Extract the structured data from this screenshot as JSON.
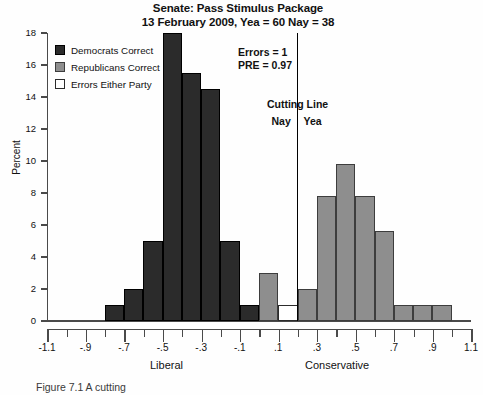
{
  "title": {
    "line1": "Senate: Pass Stimulus Package",
    "line2": "13 February 2009, Yea = 60   Nay = 38"
  },
  "legend": {
    "items": [
      {
        "label": "Democrats Correct",
        "color": "#2b2b2b",
        "key": "dem"
      },
      {
        "label": "Republicans Correct",
        "color": "#8e8e8e",
        "key": "rep"
      },
      {
        "label": "Errors Either Party",
        "color": "#ffffff",
        "key": "err"
      }
    ]
  },
  "annotation": {
    "errors": "Errors = 1",
    "pre": "PRE = 0.97"
  },
  "cutting_line": {
    "title": "Cutting Line",
    "left_label": "Nay",
    "right_label": "Yea",
    "value": 0.2
  },
  "labels": {
    "liberal": "Liberal",
    "conservative": "Conservative",
    "caption": "Figure 7.1  A cutting"
  },
  "chart_data": {
    "type": "bar",
    "title": "Senate: Pass Stimulus Package",
    "subtitle": "13 February 2009, Yea = 60   Nay = 38",
    "xlabel": "",
    "ylabel": "Percent",
    "xlim": [
      -1.1,
      1.1
    ],
    "ylim": [
      0,
      18
    ],
    "xticks": [
      -1.1,
      -0.9,
      -0.7,
      -0.5,
      -0.3,
      -0.1,
      0.1,
      0.3,
      0.5,
      0.7,
      0.9,
      1.1
    ],
    "xtick_labels": [
      "-1.1",
      "-.9",
      "-.7",
      "-.5",
      "-.3",
      "-.1",
      ".1",
      ".3",
      ".5",
      ".7",
      ".9",
      "1.1"
    ],
    "yticks": [
      0,
      2,
      4,
      6,
      8,
      10,
      12,
      14,
      16,
      18
    ],
    "ytick_labels": [
      "0",
      "2",
      "4",
      "6",
      "8",
      "10",
      "12",
      "14",
      "16",
      "18"
    ],
    "grid": false,
    "legend_position": "upper-left",
    "bin_width": 0.1,
    "bars": [
      {
        "x0": -0.8,
        "x1": -0.7,
        "value": 1.0,
        "group": "dem"
      },
      {
        "x0": -0.7,
        "x1": -0.6,
        "value": 2.0,
        "group": "dem"
      },
      {
        "x0": -0.6,
        "x1": -0.5,
        "value": 5.0,
        "group": "dem"
      },
      {
        "x0": -0.5,
        "x1": -0.4,
        "value": 18.0,
        "group": "dem"
      },
      {
        "x0": -0.4,
        "x1": -0.3,
        "value": 15.5,
        "group": "dem"
      },
      {
        "x0": -0.3,
        "x1": -0.2,
        "value": 14.5,
        "group": "dem"
      },
      {
        "x0": -0.2,
        "x1": -0.1,
        "value": 5.0,
        "group": "dem"
      },
      {
        "x0": -0.1,
        "x1": 0.0,
        "value": 1.0,
        "group": "dem"
      },
      {
        "x0": 0.0,
        "x1": 0.1,
        "value": 3.0,
        "group": "rep"
      },
      {
        "x0": 0.1,
        "x1": 0.2,
        "value": 1.0,
        "group": "err"
      },
      {
        "x0": 0.2,
        "x1": 0.3,
        "value": 2.0,
        "group": "rep"
      },
      {
        "x0": 0.3,
        "x1": 0.4,
        "value": 7.8,
        "group": "rep"
      },
      {
        "x0": 0.4,
        "x1": 0.5,
        "value": 9.8,
        "group": "rep"
      },
      {
        "x0": 0.5,
        "x1": 0.6,
        "value": 7.8,
        "group": "rep"
      },
      {
        "x0": 0.6,
        "x1": 0.7,
        "value": 5.6,
        "group": "rep"
      },
      {
        "x0": 0.7,
        "x1": 0.8,
        "value": 1.0,
        "group": "rep"
      },
      {
        "x0": 0.8,
        "x1": 0.9,
        "value": 1.0,
        "group": "rep"
      },
      {
        "x0": 0.9,
        "x1": 1.0,
        "value": 1.0,
        "group": "rep"
      }
    ],
    "annotations": [
      {
        "text": "Errors = 1"
      },
      {
        "text": "PRE = 0.97"
      },
      {
        "text": "Cutting Line",
        "x": 0.2
      }
    ]
  }
}
